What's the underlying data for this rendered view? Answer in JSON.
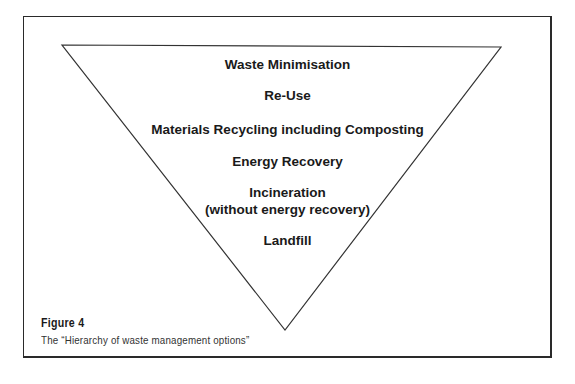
{
  "diagram": {
    "type": "inverted-triangle-hierarchy",
    "levels": [
      {
        "label": "Waste Minimisation"
      },
      {
        "label": "Re-Use"
      },
      {
        "label": "Materials Recycling including Composting"
      },
      {
        "label": "Energy Recovery"
      },
      {
        "label": "Incineration",
        "sublabel": "(without energy recovery)"
      },
      {
        "label": "Landfill"
      }
    ]
  },
  "caption": {
    "title": "Figure 4",
    "text": "The “Hierarchy of waste management options”"
  },
  "colors": {
    "line": "#333333",
    "text": "#1a1a1a",
    "background": "#ffffff"
  }
}
